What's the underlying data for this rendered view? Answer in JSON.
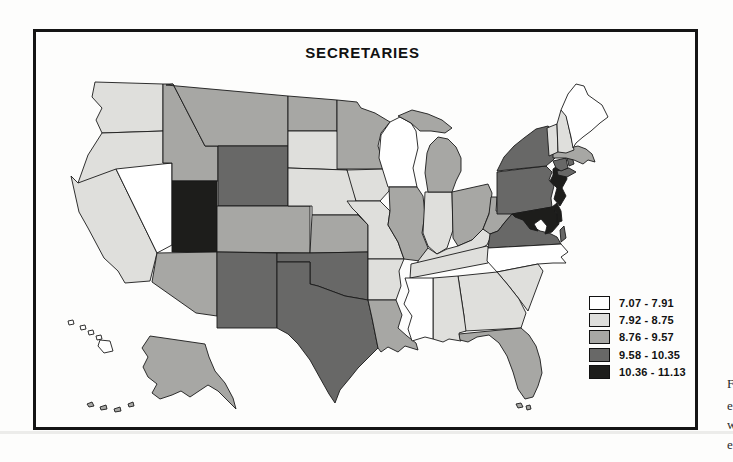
{
  "title": "SECRETARIES",
  "chart_data": {
    "type": "heatmap",
    "subtype": "choropleth-us-states",
    "title": "SECRETARIES",
    "legend_position": "right-inside",
    "legend": [
      {
        "label": "7.07 - 7.91",
        "color": "#ffffff"
      },
      {
        "label": "7.92 - 8.75",
        "color": "#dfdfdc"
      },
      {
        "label": "8.76 - 9.57",
        "color": "#a7a7a4"
      },
      {
        "label": "9.58 - 10.35",
        "color": "#686867"
      },
      {
        "label": "10.36 - 11.13",
        "color": "#1d1d1b"
      }
    ],
    "states": {
      "NV": 1,
      "WI": 1,
      "MS": 1,
      "NC": 1,
      "ME": 1,
      "HI": 1,
      "WA": 2,
      "OR": 2,
      "CA": 2,
      "SD": 2,
      "NE": 2,
      "IA": 2,
      "MO": 2,
      "AR": 2,
      "IN": 2,
      "KY": 2,
      "TN": 2,
      "AL": 2,
      "GA": 2,
      "SC": 2,
      "VT": 2,
      "NH": 2,
      "ID": 3,
      "MT": 3,
      "ND": 3,
      "MN": 3,
      "KS": 3,
      "CO": 3,
      "AZ": 3,
      "IL": 3,
      "MI": 3,
      "OH": 3,
      "WV": 3,
      "LA": 3,
      "FL": 3,
      "MA": 3,
      "AK": 3,
      "WY": 4,
      "NM": 4,
      "OK": 4,
      "TX": 4,
      "VA": 4,
      "PA": 4,
      "NY": 4,
      "CT": 4,
      "RI": 4,
      "UT": 5,
      "NJ": 5,
      "MD": 5,
      "DE": 5
    }
  },
  "frame_border_color": "#151515",
  "caption_fragments": [
    "F",
    "e",
    "w",
    "e"
  ]
}
